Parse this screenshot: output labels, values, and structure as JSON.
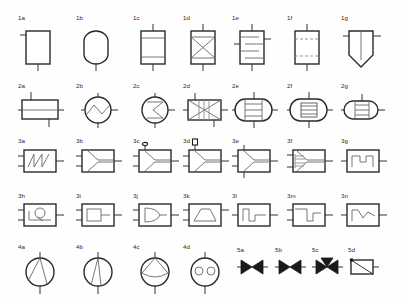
{
  "sheet": {
    "title": "Process equipment symbol legend",
    "background_color": "#fefefe",
    "line_color": "#333333",
    "body_color": "#2a2a2a",
    "accent_color": "#8c8c8c"
  },
  "rows": [
    {
      "id": "row-1",
      "items": [
        {
          "label": "1a",
          "name": "vessel-plain-rectangular",
          "x": 18,
          "y": 14
        },
        {
          "label": "1b",
          "name": "vessel-rounded-vertical",
          "x": 76,
          "y": 14
        },
        {
          "label": "1c",
          "name": "vessel-two-tray",
          "x": 133,
          "y": 14
        },
        {
          "label": "1d",
          "name": "vessel-packed-cross",
          "x": 183,
          "y": 14
        },
        {
          "label": "1e",
          "name": "vessel-multi-tray",
          "x": 232,
          "y": 14
        },
        {
          "label": "1f",
          "name": "vessel-dashed-beds",
          "x": 287,
          "y": 14
        },
        {
          "label": "1g",
          "name": "vessel-conical-bottom",
          "x": 341,
          "y": 14
        }
      ]
    },
    {
      "id": "row-2",
      "items": [
        {
          "label": "2a",
          "name": "horizontal-drum-divided",
          "x": 18,
          "y": 82
        },
        {
          "label": "2b",
          "name": "circle-zigzag-exchanger",
          "x": 76,
          "y": 82
        },
        {
          "label": "2c",
          "name": "circle-sigma-exchanger",
          "x": 133,
          "y": 82
        },
        {
          "label": "2d",
          "name": "box-crossed-exchanger",
          "x": 183,
          "y": 82
        },
        {
          "label": "2e",
          "name": "shell-tube-exchanger",
          "x": 232,
          "y": 82
        },
        {
          "label": "2f",
          "name": "shell-tube-bundle",
          "x": 287,
          "y": 82
        },
        {
          "label": "2g",
          "name": "shell-tube-short",
          "x": 341,
          "y": 82
        }
      ]
    },
    {
      "id": "row-3",
      "items": [
        {
          "label": "3a",
          "name": "box-sawtooth-signal",
          "x": 18,
          "y": 137
        },
        {
          "label": "3b",
          "name": "box-wedge-mixer",
          "x": 76,
          "y": 137
        },
        {
          "label": "3c",
          "name": "box-wedge-vent-valve",
          "x": 133,
          "y": 137
        },
        {
          "label": "3d",
          "name": "box-wedge-square-vent",
          "x": 183,
          "y": 137
        },
        {
          "label": "3e",
          "name": "box-wedge-two-ports",
          "x": 232,
          "y": 137
        },
        {
          "label": "3f",
          "name": "box-wedge-multi-feed",
          "x": 287,
          "y": 137
        },
        {
          "label": "3g",
          "name": "box-step-pulse",
          "x": 341,
          "y": 137
        }
      ]
    },
    {
      "id": "row-4",
      "items": [
        {
          "label": "3h",
          "name": "box-circle-tangent",
          "x": 18,
          "y": 192
        },
        {
          "label": "3i",
          "name": "box-inner-rectangle",
          "x": 76,
          "y": 192
        },
        {
          "label": "3j",
          "name": "box-or-gate",
          "x": 133,
          "y": 192
        },
        {
          "label": "3k",
          "name": "box-trapezoid",
          "x": 183,
          "y": 192
        },
        {
          "label": "3l",
          "name": "box-step-down-signal",
          "x": 232,
          "y": 192
        },
        {
          "label": "3m",
          "name": "box-step-up-signal",
          "x": 287,
          "y": 192
        },
        {
          "label": "3n",
          "name": "box-peak-signal",
          "x": 341,
          "y": 192
        }
      ]
    },
    {
      "id": "row-5",
      "items": [
        {
          "label": "4a",
          "name": "pump-centrifugal-vane",
          "x": 18,
          "y": 243
        },
        {
          "label": "4b",
          "name": "pump-narrow-vane",
          "x": 76,
          "y": 243
        },
        {
          "label": "4c",
          "name": "pump-chord-vane",
          "x": 133,
          "y": 243
        },
        {
          "label": "4d",
          "name": "pump-twin-lobe",
          "x": 183,
          "y": 243
        },
        {
          "label": "5a",
          "name": "valve-gate",
          "x": 237,
          "y": 246
        },
        {
          "label": "5b",
          "name": "valve-gate-filled",
          "x": 275,
          "y": 246
        },
        {
          "label": "5c",
          "name": "valve-three-way",
          "x": 312,
          "y": 246
        },
        {
          "label": "5d",
          "name": "damper-blade",
          "x": 348,
          "y": 246
        }
      ]
    }
  ]
}
